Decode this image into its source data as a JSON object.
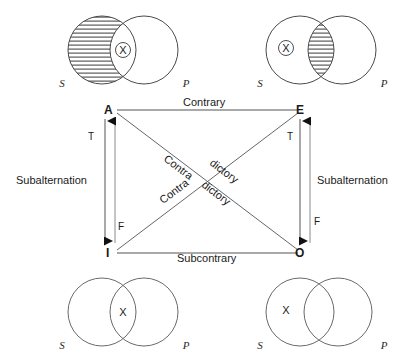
{
  "diagram": {
    "stroke_color": "#4a4a4a",
    "line_color": "#555555",
    "text_color": "#1a1a1a"
  },
  "square": {
    "corners": {
      "a": "A",
      "e": "E",
      "i": "I",
      "o": "O"
    },
    "relations": {
      "contrary": "Contrary",
      "subcontrary": "Subcontrary",
      "contradictory_part1": "Contra",
      "contradictory_part2": "dictory",
      "subalternation_left": "Subalternation",
      "subalternation_right": "Subalternation"
    },
    "truth_values": {
      "left_top": "T",
      "left_bottom": "F",
      "right_top": "T",
      "right_bottom": "F"
    }
  },
  "venns": {
    "top_left": {
      "name": "A-proposition",
      "subject_label": "S",
      "predicate_label": "P",
      "x_mark": "X",
      "x_circled": true,
      "x_region": "intersection",
      "shaded_region": "subject-only"
    },
    "top_right": {
      "name": "E-proposition",
      "subject_label": "S",
      "predicate_label": "P",
      "x_mark": "X",
      "x_circled": true,
      "x_region": "subject-only",
      "shaded_region": "intersection"
    },
    "bottom_left": {
      "name": "I-proposition",
      "subject_label": "S",
      "predicate_label": "P",
      "x_mark": "X",
      "x_circled": false,
      "x_region": "intersection",
      "shaded_region": "none"
    },
    "bottom_right": {
      "name": "O-proposition",
      "subject_label": "S",
      "predicate_label": "P",
      "x_mark": "X",
      "x_circled": false,
      "x_region": "subject-only",
      "shaded_region": "none"
    }
  }
}
